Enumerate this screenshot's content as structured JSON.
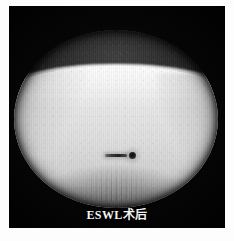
{
  "figure": {
    "kind": "fluoroscopy-radiograph",
    "caption": "ESWL术后",
    "caption_romanized": "ESWL shuhou",
    "panel": {
      "background_color": "#050505",
      "border_color": "#fdfdfd"
    },
    "field_of_view": {
      "shape": "circle",
      "label": "circular-fluoroscopic-field"
    },
    "regions": [
      {
        "name": "upper-dark-field",
        "description": "dark lung / air region above diaphragm",
        "tone": "#2a2a2a"
      },
      {
        "name": "diaphragm-edge",
        "description": "bright curved diaphragm / soft-tissue boundary",
        "tone": "#ffffff"
      },
      {
        "name": "soft-tissue-mass",
        "description": "bright abdominal soft tissue region",
        "tone": "#e6e6e6"
      },
      {
        "name": "lower-shade",
        "description": "darker lower abdomen / pelvis",
        "tone": "#8c8c8c"
      },
      {
        "name": "spine-striations",
        "description": "vertical vertebral striations at lower center",
        "tone": "#555555"
      }
    ],
    "markers": [
      {
        "name": "linear-marker",
        "description": "elongated radiopaque stent / catheter fragment",
        "tone": "#232323"
      },
      {
        "name": "round-marker",
        "description": "dense round calculus fragment",
        "tone": "#0d0d0d"
      }
    ]
  }
}
